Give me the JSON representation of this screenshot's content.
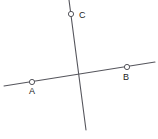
{
  "figure": {
    "kind": "geometry-diagram",
    "width": 158,
    "height": 139,
    "background_color": "#ffffff",
    "line_color": "#55555c",
    "point_stroke_color": "#55555c",
    "point_fill_color": "#ffffff",
    "label_color": "#1c1c1c",
    "line_width": 1.1,
    "label_font_size": 9
  },
  "lines": [
    {
      "id": "line-ab",
      "name": "line-through-a-and-b",
      "x1": 4,
      "y1": 86,
      "x2": 155,
      "y2": 62
    },
    {
      "id": "line-c",
      "name": "line-through-c",
      "x1": 69,
      "y1": 0,
      "x2": 86,
      "y2": 130
    }
  ],
  "points": [
    {
      "id": "point-a",
      "label": "A",
      "cx": 32,
      "cy": 82,
      "r": 2.6,
      "label_x": 32,
      "label_y": 94
    },
    {
      "id": "point-b",
      "label": "B",
      "cx": 127,
      "cy": 67,
      "r": 2.6,
      "label_x": 126,
      "label_y": 80
    },
    {
      "id": "point-c",
      "label": "C",
      "cx": 71,
      "cy": 14,
      "r": 2.6,
      "label_x": 79,
      "label_y": 18
    }
  ],
  "intersection": {
    "id": "intersection-point",
    "x": 78,
    "y": 76
  }
}
